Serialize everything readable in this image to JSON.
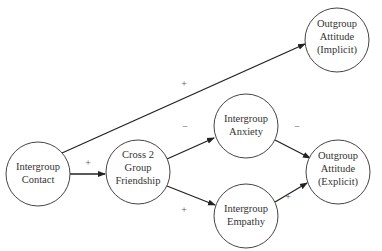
{
  "diagram": {
    "type": "path-model",
    "nodes": [
      {
        "id": "contact",
        "lines": [
          "Intergroup",
          "Contact"
        ],
        "cx": 38,
        "cy": 174,
        "r": 32
      },
      {
        "id": "friendship",
        "lines": [
          "Cross 2",
          "Group",
          "Friendship"
        ],
        "cx": 138,
        "cy": 172,
        "r": 32
      },
      {
        "id": "anxiety",
        "lines": [
          "Intergroup",
          "Anxiety"
        ],
        "cx": 246,
        "cy": 126,
        "r": 32
      },
      {
        "id": "empathy",
        "lines": [
          "Intergroup",
          "Empathy"
        ],
        "cx": 246,
        "cy": 216,
        "r": 32
      },
      {
        "id": "explicit",
        "lines": [
          "Outgroup",
          "Attitude",
          "(Explicit)"
        ],
        "cx": 338,
        "cy": 172,
        "r": 32
      },
      {
        "id": "implicit",
        "lines": [
          "Outgroup",
          "Attitude",
          "(Implicit)"
        ],
        "cx": 337,
        "cy": 40,
        "r": 32
      }
    ],
    "edges": [
      {
        "from": "contact",
        "to": "friendship",
        "sign": "+"
      },
      {
        "from": "contact",
        "to": "implicit",
        "sign": "+"
      },
      {
        "from": "friendship",
        "to": "anxiety",
        "sign": "−"
      },
      {
        "from": "friendship",
        "to": "empathy",
        "sign": "+"
      },
      {
        "from": "anxiety",
        "to": "explicit",
        "sign": "−"
      },
      {
        "from": "empathy",
        "to": "explicit",
        "sign": "+"
      }
    ]
  }
}
